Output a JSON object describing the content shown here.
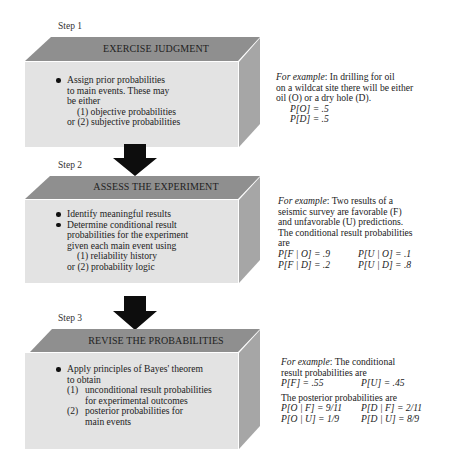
{
  "colors": {
    "top_face": "#8f8f8f",
    "front_face": "#e3e3e3",
    "side_face": "#a6a6a6",
    "arrow": "#0d0d0d",
    "text": "#222222"
  },
  "steps": [
    {
      "label": "Step 1",
      "title": "EXERCISE JUDGMENT",
      "body": {
        "bullets": [
          [
            "Assign prior probabilities",
            "to main events.  These may",
            "be either"
          ]
        ],
        "options": [
          "(1)  objective probabilities",
          "or (2)  subjective probabilities"
        ]
      },
      "example": {
        "lead": "For example",
        "lines": [
          ":  In drilling for oil",
          "on a wildcat site there will be either",
          "oil (O) or a dry hole (D)."
        ],
        "probs": [
          "P[O] = .5",
          "P[D] = .5"
        ]
      }
    },
    {
      "label": "Step 2",
      "title": "ASSESS THE EXPERIMENT",
      "body": {
        "bullets": [
          [
            "Identify meaningful results"
          ],
          [
            "Determine conditional result",
            "probabilities for the experiment",
            "given each main event using"
          ]
        ],
        "options": [
          "(1)  reliability history",
          "or (2)  probability logic"
        ]
      },
      "example": {
        "lead": "For example",
        "lines": [
          ":  Two results of a",
          "seismic survey are favorable (F)",
          "and unfavorable (U) predictions.",
          "The conditional result probabilities",
          "are"
        ],
        "probs": [
          [
            "P[F | O] = .9",
            "P[U | O] = .1"
          ],
          [
            "P[F | D] = .2",
            "P[U | D] = .8"
          ]
        ]
      }
    },
    {
      "label": "Step 3",
      "title": "REVISE THE PROBABILITIES",
      "body": {
        "bullets": [
          [
            "Apply principles of Bayes' theorem",
            "to obtain"
          ]
        ],
        "numbered": [
          {
            "n": "(1)",
            "lines": [
              "unconditional result probabilities",
              "for experimental outcomes"
            ]
          },
          {
            "n": "(2)",
            "lines": [
              "posterior probabilities for",
              "main events"
            ]
          }
        ]
      },
      "example": {
        "lead": "For example",
        "lines": [
          ":  The conditional",
          "result probabilities are"
        ],
        "probs_unconditional": [
          "P[F] = .55",
          "P[U] = .45"
        ],
        "posterior_heading": "The posterior probabilities are",
        "probs_posterior": [
          [
            "P[O | F] = 9/11",
            "P[D | F] = 2/11"
          ],
          [
            "P[O | U] = 1/9",
            "P[D | U] = 8/9"
          ]
        ]
      }
    }
  ]
}
